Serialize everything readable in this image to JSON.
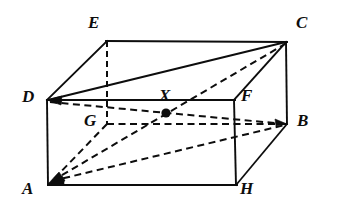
{
  "figure": {
    "kind": "geometry-diagram",
    "shape": "rectangular-cuboid",
    "canvas": {
      "width": 338,
      "height": 210
    },
    "background_color": "#ffffff",
    "ink_color": "#0d0d0d"
  },
  "vertices": [
    {
      "id": "E",
      "label": "E",
      "x": 107,
      "y": 41,
      "label_x": 88,
      "label_y": 14,
      "hidden": false
    },
    {
      "id": "C",
      "label": "C",
      "x": 286,
      "y": 42,
      "label_x": 296,
      "label_y": 14,
      "hidden": false
    },
    {
      "id": "D",
      "label": "D",
      "x": 47,
      "y": 100,
      "label_x": 22,
      "label_y": 88,
      "hidden": false
    },
    {
      "id": "X",
      "label": "X",
      "x": 166,
      "y": 113,
      "label_x": 159,
      "label_y": 87,
      "hidden": false
    },
    {
      "id": "F",
      "label": "F",
      "x": 234,
      "y": 100,
      "label_x": 241,
      "label_y": 87,
      "hidden": false
    },
    {
      "id": "G",
      "label": "G",
      "x": 107,
      "y": 124,
      "label_x": 84,
      "label_y": 112,
      "hidden": true
    },
    {
      "id": "B",
      "label": "B",
      "x": 287,
      "y": 124,
      "label_x": 297,
      "label_y": 112,
      "hidden": false
    },
    {
      "id": "A",
      "label": "A",
      "x": 48,
      "y": 184,
      "label_x": 22,
      "label_y": 180,
      "hidden": false
    },
    {
      "id": "H",
      "label": "H",
      "x": 236,
      "y": 185,
      "label_x": 240,
      "label_y": 180,
      "hidden": false
    }
  ],
  "marked_points": [
    {
      "id": "X",
      "label": "X",
      "x": 166,
      "y": 113,
      "radius": 4.6,
      "description": "marked point on diagonal"
    }
  ],
  "edges": [
    {
      "id": "E-C",
      "from": "E",
      "to": "C",
      "style": "solid",
      "visible": true
    },
    {
      "id": "E-D",
      "from": "E",
      "to": "D",
      "style": "solid",
      "visible": true
    },
    {
      "id": "E-G",
      "from": "E",
      "to": "G",
      "style": "dashed",
      "visible": false
    },
    {
      "id": "D-C",
      "from": "D",
      "to": "C",
      "style": "solid",
      "visible": true
    },
    {
      "id": "D-F",
      "from": "D",
      "to": "F",
      "style": "solid",
      "visible": true
    },
    {
      "id": "D-A",
      "from": "D",
      "to": "A",
      "style": "solid",
      "visible": true
    },
    {
      "id": "C-F",
      "from": "C",
      "to": "F",
      "style": "solid",
      "visible": true
    },
    {
      "id": "C-B",
      "from": "C",
      "to": "B",
      "style": "solid",
      "visible": true
    },
    {
      "id": "F-H",
      "from": "F",
      "to": "H",
      "style": "solid",
      "visible": true
    },
    {
      "id": "A-H",
      "from": "A",
      "to": "H",
      "style": "solid",
      "visible": true
    },
    {
      "id": "H-B",
      "from": "H",
      "to": "B",
      "style": "solid",
      "visible": true
    },
    {
      "id": "G-B",
      "from": "G",
      "to": "B",
      "style": "dashed",
      "visible": false
    },
    {
      "id": "G-A",
      "from": "G",
      "to": "A",
      "style": "dashed",
      "visible": false
    },
    {
      "id": "D-B",
      "from": "D",
      "to": "B",
      "style": "dashed",
      "visible": false
    },
    {
      "id": "A-C",
      "from": "A",
      "to": "C",
      "style": "dashed",
      "visible": false
    },
    {
      "id": "A-B",
      "from": "A",
      "to": "B",
      "style": "dashed",
      "visible": false
    }
  ],
  "arrowheads": [
    {
      "id": "arrow-at-D-from-C",
      "at": "D",
      "from": "C"
    },
    {
      "id": "arrow-at-D-from-F",
      "at": "D",
      "from": "F"
    },
    {
      "id": "arrow-at-A-from-C",
      "at": "A",
      "from": "C"
    },
    {
      "id": "arrow-at-A-from-G",
      "at": "A",
      "from": "G"
    },
    {
      "id": "arrow-at-A-from-B",
      "at": "A",
      "from": "B"
    },
    {
      "id": "arrow-at-B-from-D",
      "at": "B",
      "from": "D"
    }
  ]
}
